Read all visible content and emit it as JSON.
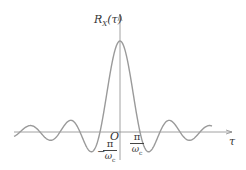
{
  "chart_data": {
    "type": "line",
    "title": "",
    "function": "R_X(tau) = sinc-like autocorrelation, sin(omega_c * tau) / (omega_c * tau)",
    "xlabel": "τ",
    "ylabel": "R_X(τ)",
    "origin_label": "O",
    "tick_labels": [
      {
        "position": "-pi/omega_c",
        "text_num": "π",
        "text_den": "ω",
        "den_sub": "c",
        "sign": "−"
      },
      {
        "position": "pi/omega_c",
        "text_num": "π",
        "text_den": "ω",
        "den_sub": "c",
        "sign": ""
      }
    ],
    "x": [
      -5.5,
      -5,
      -4.5,
      -4,
      -3.5,
      -3,
      -2.5,
      -2,
      -1.5,
      -1,
      -0.5,
      0,
      0.5,
      1,
      1.5,
      2,
      2.5,
      3,
      3.5,
      4,
      4.5,
      5,
      5.5
    ],
    "values": [
      -0.06,
      0,
      0.07,
      0,
      -0.09,
      0,
      0.13,
      0,
      -0.21,
      0,
      0.64,
      1,
      0.64,
      0,
      -0.21,
      0,
      0.13,
      0,
      -0.09,
      0,
      0.07,
      0,
      -0.06
    ],
    "x_units": "multiples of π/ω_c",
    "grid": false,
    "legend": null,
    "colors": {
      "curve": "#9a9a9a",
      "axis": "#8a8a8a",
      "text": "#333333"
    }
  },
  "labels": {
    "y_axis_name": "R",
    "y_axis_sub": "X",
    "y_axis_arg": "(τ)",
    "x_axis_name": "τ",
    "origin": "O",
    "pi": "π",
    "omega": "ω",
    "c": "c",
    "minus": "−"
  }
}
